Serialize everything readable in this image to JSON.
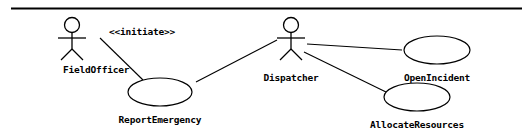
{
  "diagram": {
    "kind": "uml-use-case-diagram",
    "background_color": "#ffffff",
    "stroke_color": "#000000",
    "top_rule": {
      "name": "horizontal-rule",
      "x1": 11,
      "y1": 8.5,
      "x2": 522,
      "y2": 8.5,
      "width": 2.0
    },
    "actors": [
      {
        "id": "field-officer",
        "label": "FieldOfficer",
        "cx": 72,
        "head_cy": 25,
        "head_r": 7.5,
        "body_top": 33,
        "body_bottom": 49,
        "arm_y": 38,
        "arm_half": 14,
        "leg_spread": 11,
        "leg_bottom": 60,
        "label_x": 63,
        "label_y": 65
      },
      {
        "id": "dispatcher",
        "label": "Dispatcher",
        "cx": 291,
        "head_cy": 25,
        "head_r": 7.5,
        "body_top": 33,
        "body_bottom": 49,
        "arm_y": 38,
        "arm_half": 14,
        "leg_spread": 11,
        "leg_bottom": 60,
        "label_x": 291,
        "label_y": 73
      }
    ],
    "use_cases": [
      {
        "id": "report-emergency",
        "label": "ReportEmergency",
        "cx": 160,
        "cy": 92,
        "rx": 32,
        "ry": 14,
        "label_x": 160,
        "label_y": 115
      },
      {
        "id": "open-incident",
        "label": "OpenIncident",
        "cx": 437,
        "cy": 50,
        "rx": 33,
        "ry": 14,
        "label_x": 437,
        "label_y": 73
      },
      {
        "id": "allocate-resources",
        "label": "AllocateResources",
        "cx": 417,
        "cy": 97,
        "rx": 33,
        "ry": 14,
        "label_x": 417,
        "label_y": 120
      }
    ],
    "associations": [
      {
        "id": "field-officer-report-emergency",
        "from": "field-officer",
        "to": "report-emergency",
        "x1": 100,
        "y1": 38,
        "x2": 143,
        "y2": 80
      },
      {
        "id": "report-emergency-dispatcher",
        "from": "report-emergency",
        "to": "dispatcher",
        "x1": 196,
        "y1": 82,
        "x2": 277,
        "y2": 40
      },
      {
        "id": "dispatcher-open-incident",
        "from": "dispatcher",
        "to": "open-incident",
        "x1": 307,
        "y1": 44,
        "x2": 402,
        "y2": 50
      },
      {
        "id": "dispatcher-allocate-resources",
        "from": "dispatcher",
        "to": "allocate-resources",
        "x1": 304,
        "y1": 52,
        "x2": 386,
        "y2": 92
      }
    ],
    "stereotypes": [
      {
        "id": "initiate",
        "label": "<<initiate>>",
        "x": 142,
        "y": 27
      }
    ]
  }
}
